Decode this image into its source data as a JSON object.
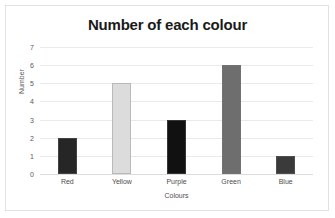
{
  "chart_data": {
    "type": "bar",
    "title": "Number of each colour",
    "xlabel": "Colours",
    "ylabel": "Number",
    "categories": [
      "Red",
      "Yellow",
      "Purple",
      "Green",
      "Blue"
    ],
    "values": [
      2,
      5,
      3,
      6,
      1
    ],
    "bar_colors": [
      "#262626",
      "#dcdcdc",
      "#111111",
      "#6e6e6e",
      "#3a3a3a"
    ],
    "ylim": [
      0,
      7
    ],
    "yticks": [
      0,
      1,
      2,
      3,
      4,
      5,
      6,
      7
    ],
    "ytick_labels": [
      "0",
      "1",
      "2",
      "3",
      "4",
      "5",
      "6",
      "7"
    ],
    "grid": true,
    "grid_axis": "y",
    "legend": false,
    "legend_position": "none",
    "background": "#ffffff",
    "gridline_color": "#e9e9e9",
    "axis_color": "#dcdcdc",
    "border_color": "#e2e2e2",
    "title_color": "#1a1a1a",
    "tick_label_color": "#5a5a5a"
  }
}
